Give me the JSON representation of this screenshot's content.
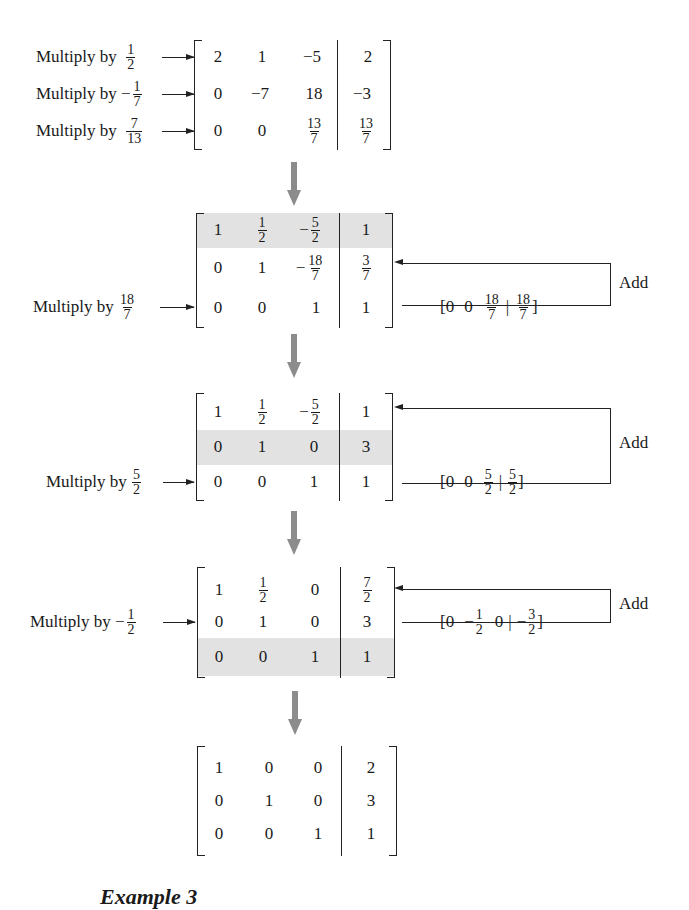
{
  "diagram": {
    "arrow_color": "#8c8c8c",
    "highlight_color": "#e2e2e2",
    "steps": [
      {
        "matrix": [
          [
            "2",
            "1",
            "−5",
            "2"
          ],
          [
            "0",
            "−7",
            "18",
            "−3"
          ],
          [
            "0",
            "0",
            "13/7",
            "13/7"
          ]
        ],
        "row_ops": [
          {
            "row": 1,
            "label": "Multiply by",
            "factor": "1/2"
          },
          {
            "row": 2,
            "label": "Multiply by",
            "factor": "−1/7"
          },
          {
            "row": 3,
            "label": "Multiply by",
            "factor": "7/13"
          }
        ]
      },
      {
        "matrix": [
          [
            "1",
            "1/2",
            "−5/2",
            "1"
          ],
          [
            "0",
            "1",
            "−18/7",
            "3/7"
          ],
          [
            "0",
            "0",
            "1",
            "1"
          ]
        ],
        "highlight_row": 1,
        "row_ops": [
          {
            "row": 3,
            "label": "Multiply by",
            "factor": "18/7"
          }
        ],
        "added_vector": [
          "0",
          "0",
          "18/7",
          "18/7"
        ],
        "add_label": "Add",
        "add_target_row": 2
      },
      {
        "matrix": [
          [
            "1",
            "1/2",
            "−5/2",
            "1"
          ],
          [
            "0",
            "1",
            "0",
            "3"
          ],
          [
            "0",
            "0",
            "1",
            "1"
          ]
        ],
        "highlight_row": 2,
        "row_ops": [
          {
            "row": 3,
            "label": "Multiply by",
            "factor": "5/2"
          }
        ],
        "added_vector": [
          "0",
          "0",
          "5/2",
          "5/2"
        ],
        "add_label": "Add",
        "add_target_row": 1
      },
      {
        "matrix": [
          [
            "1",
            "1/2",
            "0",
            "7/2"
          ],
          [
            "0",
            "1",
            "0",
            "3"
          ],
          [
            "0",
            "0",
            "1",
            "1"
          ]
        ],
        "highlight_row": 3,
        "row_ops": [
          {
            "row": 2,
            "label": "Multiply by",
            "factor": "−1/2"
          }
        ],
        "added_vector": [
          "0",
          "−1/2",
          "0",
          "−3/2"
        ],
        "add_label": "Add",
        "add_target_row": 1
      },
      {
        "matrix": [
          [
            "1",
            "0",
            "0",
            "2"
          ],
          [
            "0",
            "1",
            "0",
            "3"
          ],
          [
            "0",
            "0",
            "1",
            "1"
          ]
        ]
      }
    ],
    "caption": "Example 3"
  }
}
